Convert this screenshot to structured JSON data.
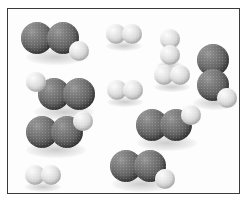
{
  "figure": {
    "name": "molecular-space-filling-diagram",
    "background_color": "#ffffff",
    "frame_color": "#3a3a3a",
    "panel_color": "#fdfdfd",
    "width": 250,
    "height": 206
  },
  "atom_types": {
    "heavy": {
      "label": "large-dark-atom",
      "color": "#6e6e6e",
      "radius": 14
    },
    "light": {
      "label": "small-light-atom",
      "color": "#dcdcdc",
      "radius": 9
    }
  },
  "counts": {
    "triatomic_molecules": 6,
    "diatomic_light_molecules": 5,
    "total_molecules": 11
  },
  "molecules": [
    {
      "id": "triatomic-1",
      "type": "triatomic",
      "label": "two-heavy-one-light",
      "atoms": [
        {
          "kind": "heavy",
          "cx": 37,
          "cy": 38,
          "r": 16
        },
        {
          "kind": "heavy",
          "cx": 63,
          "cy": 38,
          "r": 16
        },
        {
          "kind": "light",
          "cx": 79,
          "cy": 51,
          "r": 10
        }
      ],
      "shadow": {
        "cx": 56,
        "cy": 57,
        "rx": 30,
        "ry": 8
      }
    },
    {
      "id": "triatomic-2",
      "type": "triatomic",
      "label": "two-heavy-one-light",
      "atoms": [
        {
          "kind": "light",
          "cx": 36,
          "cy": 82,
          "r": 10
        },
        {
          "kind": "heavy",
          "cx": 54,
          "cy": 94,
          "r": 16
        },
        {
          "kind": "heavy",
          "cx": 79,
          "cy": 94,
          "r": 16
        }
      ],
      "shadow": {
        "cx": 64,
        "cy": 112,
        "rx": 30,
        "ry": 8
      }
    },
    {
      "id": "triatomic-3",
      "type": "triatomic",
      "label": "two-heavy-one-light",
      "atoms": [
        {
          "kind": "heavy",
          "cx": 42,
          "cy": 132,
          "r": 16
        },
        {
          "kind": "heavy",
          "cx": 67,
          "cy": 132,
          "r": 16
        },
        {
          "kind": "light",
          "cx": 83,
          "cy": 121,
          "r": 10
        }
      ],
      "shadow": {
        "cx": 56,
        "cy": 150,
        "rx": 30,
        "ry": 8
      }
    },
    {
      "id": "triatomic-4",
      "type": "triatomic",
      "label": "two-heavy-one-light-vertical",
      "atoms": [
        {
          "kind": "heavy",
          "cx": 213,
          "cy": 60,
          "r": 16
        },
        {
          "kind": "heavy",
          "cx": 213,
          "cy": 85,
          "r": 16
        },
        {
          "kind": "light",
          "cx": 227,
          "cy": 98,
          "r": 10
        }
      ],
      "shadow": {
        "cx": 215,
        "cy": 103,
        "rx": 22,
        "ry": 7
      }
    },
    {
      "id": "triatomic-5",
      "type": "triatomic",
      "label": "two-heavy-one-light",
      "atoms": [
        {
          "kind": "heavy",
          "cx": 152,
          "cy": 125,
          "r": 16
        },
        {
          "kind": "heavy",
          "cx": 176,
          "cy": 125,
          "r": 16
        },
        {
          "kind": "light",
          "cx": 191,
          "cy": 115,
          "r": 10
        }
      ],
      "shadow": {
        "cx": 167,
        "cy": 143,
        "rx": 30,
        "ry": 8
      }
    },
    {
      "id": "triatomic-6",
      "type": "triatomic",
      "label": "two-heavy-one-light",
      "atoms": [
        {
          "kind": "heavy",
          "cx": 126,
          "cy": 166,
          "r": 16
        },
        {
          "kind": "heavy",
          "cx": 150,
          "cy": 166,
          "r": 16
        },
        {
          "kind": "light",
          "cx": 165,
          "cy": 179,
          "r": 10
        }
      ],
      "shadow": {
        "cx": 142,
        "cy": 184,
        "rx": 30,
        "ry": 8
      }
    },
    {
      "id": "diatomic-1",
      "type": "diatomic",
      "label": "two-light-atoms",
      "atoms": [
        {
          "kind": "light",
          "cx": 116,
          "cy": 34,
          "r": 10
        },
        {
          "kind": "light",
          "cx": 132,
          "cy": 34,
          "r": 10
        }
      ],
      "shadow": {
        "cx": 124,
        "cy": 46,
        "rx": 18,
        "ry": 5
      }
    },
    {
      "id": "diatomic-2",
      "type": "diatomic",
      "label": "two-light-atoms-vertical",
      "atoms": [
        {
          "kind": "light",
          "cx": 170,
          "cy": 39,
          "r": 10
        },
        {
          "kind": "light",
          "cx": 170,
          "cy": 55,
          "r": 10
        }
      ],
      "shadow": {
        "cx": 170,
        "cy": 66,
        "rx": 13,
        "ry": 5
      }
    },
    {
      "id": "diatomic-3",
      "type": "diatomic",
      "label": "two-light-atoms",
      "atoms": [
        {
          "kind": "light",
          "cx": 164,
          "cy": 75,
          "r": 10
        },
        {
          "kind": "light",
          "cx": 180,
          "cy": 75,
          "r": 10
        }
      ],
      "shadow": {
        "cx": 172,
        "cy": 87,
        "rx": 18,
        "ry": 5
      }
    },
    {
      "id": "diatomic-4",
      "type": "diatomic",
      "label": "two-light-atoms",
      "atoms": [
        {
          "kind": "light",
          "cx": 117,
          "cy": 90,
          "r": 10
        },
        {
          "kind": "light",
          "cx": 133,
          "cy": 90,
          "r": 10
        }
      ],
      "shadow": {
        "cx": 125,
        "cy": 102,
        "rx": 18,
        "ry": 5
      }
    },
    {
      "id": "diatomic-5",
      "type": "diatomic",
      "label": "two-light-atoms",
      "atoms": [
        {
          "kind": "light",
          "cx": 35,
          "cy": 175,
          "r": 10
        },
        {
          "kind": "light",
          "cx": 51,
          "cy": 175,
          "r": 10
        }
      ],
      "shadow": {
        "cx": 43,
        "cy": 187,
        "rx": 18,
        "ry": 5
      }
    }
  ]
}
